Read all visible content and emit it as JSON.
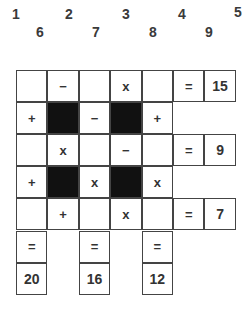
{
  "number_bank": {
    "top_row": [
      "1",
      "2",
      "3",
      "4",
      "5"
    ],
    "bottom_row": [
      "6",
      "7",
      "8",
      "9"
    ]
  },
  "puzzle": {
    "rows": 7,
    "cols": 7,
    "cells": [
      [
        {
          "t": "blank"
        },
        {
          "t": "op",
          "v": "−"
        },
        {
          "t": "blank"
        },
        {
          "t": "op",
          "v": "x"
        },
        {
          "t": "blank"
        },
        {
          "t": "op",
          "v": "="
        },
        {
          "t": "result",
          "v": "15"
        }
      ],
      [
        {
          "t": "op",
          "v": "+"
        },
        {
          "t": "black"
        },
        {
          "t": "op",
          "v": "−"
        },
        {
          "t": "black"
        },
        {
          "t": "op",
          "v": "+"
        },
        {
          "t": "none"
        },
        {
          "t": "none"
        }
      ],
      [
        {
          "t": "blank"
        },
        {
          "t": "op",
          "v": "x"
        },
        {
          "t": "blank"
        },
        {
          "t": "op",
          "v": "−"
        },
        {
          "t": "blank"
        },
        {
          "t": "op",
          "v": "="
        },
        {
          "t": "result",
          "v": "9"
        }
      ],
      [
        {
          "t": "op",
          "v": "+"
        },
        {
          "t": "black"
        },
        {
          "t": "op",
          "v": "x"
        },
        {
          "t": "black"
        },
        {
          "t": "op",
          "v": "x"
        },
        {
          "t": "none"
        },
        {
          "t": "none"
        }
      ],
      [
        {
          "t": "blank"
        },
        {
          "t": "op",
          "v": "+"
        },
        {
          "t": "blank"
        },
        {
          "t": "op",
          "v": "x"
        },
        {
          "t": "blank"
        },
        {
          "t": "op",
          "v": "="
        },
        {
          "t": "result",
          "v": "7"
        }
      ],
      [
        {
          "t": "op",
          "v": "="
        },
        {
          "t": "none"
        },
        {
          "t": "op",
          "v": "="
        },
        {
          "t": "none"
        },
        {
          "t": "op",
          "v": "="
        },
        {
          "t": "none"
        },
        {
          "t": "none"
        }
      ],
      [
        {
          "t": "result",
          "v": "20"
        },
        {
          "t": "none"
        },
        {
          "t": "result",
          "v": "16"
        },
        {
          "t": "none"
        },
        {
          "t": "result",
          "v": "12"
        },
        {
          "t": "none"
        },
        {
          "t": "none"
        }
      ]
    ]
  }
}
